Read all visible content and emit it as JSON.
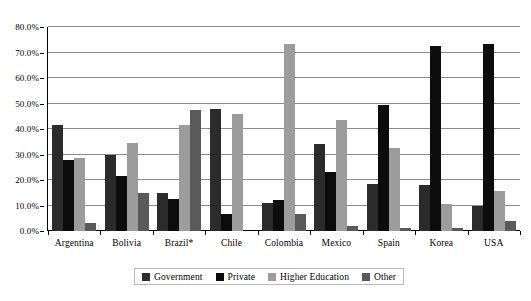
{
  "chart_data": {
    "type": "bar",
    "title": "",
    "xlabel": "",
    "ylabel": "",
    "ylim": [
      0,
      80
    ],
    "yticks": [
      0,
      10,
      20,
      30,
      40,
      50,
      60,
      70,
      80
    ],
    "ytick_labels": [
      "0.0%",
      "10.0%",
      "20.0%",
      "30.0%",
      "40.0%",
      "50.0%",
      "60.0%",
      "70.0%",
      "80.0%"
    ],
    "grid": true,
    "legend_position": "bottom",
    "categories": [
      "Argentina",
      "Bolivia",
      "Brazil*",
      "Chile",
      "Colombia",
      "Mexico",
      "Spain",
      "Korea",
      "USA"
    ],
    "series": [
      {
        "name": "Government",
        "color": "#2b2b2b",
        "values": [
          41.5,
          30.0,
          15.0,
          48.0,
          11.0,
          34.0,
          18.5,
          18.0,
          10.0
        ]
      },
      {
        "name": "Private",
        "color": "#0c0c0c",
        "values": [
          28.0,
          21.5,
          12.5,
          6.5,
          12.0,
          23.0,
          49.5,
          72.5,
          73.5
        ]
      },
      {
        "name": "Higher Education",
        "color": "#9c9c9c",
        "values": [
          28.5,
          34.5,
          41.5,
          46.0,
          73.5,
          43.5,
          32.5,
          10.5,
          15.5
        ]
      },
      {
        "name": "Other",
        "color": "#5a5a5a",
        "values": [
          3.0,
          15.0,
          47.5,
          0.0,
          6.5,
          2.0,
          1.0,
          1.0,
          4.0
        ]
      }
    ]
  }
}
